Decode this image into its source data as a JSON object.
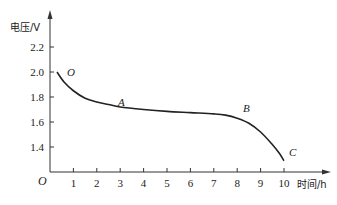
{
  "chart_data": {
    "type": "line",
    "title": "",
    "xlabel": "时间/h",
    "ylabel": "电压/V",
    "origin_label": "O",
    "x_ticks": [
      "1",
      "2",
      "3",
      "4",
      "5",
      "6",
      "7",
      "8",
      "9",
      "10"
    ],
    "y_ticks": [
      "1.4",
      "1.6",
      "1.8",
      "2.0",
      "2.2"
    ],
    "xlim": [
      0,
      10.5
    ],
    "ylim": [
      1.2,
      2.35
    ],
    "grid": false,
    "legend": null,
    "series": [
      {
        "name": "discharge curve",
        "x": [
          0.3,
          0.6,
          1.0,
          1.5,
          2.0,
          2.5,
          3.0,
          4.0,
          5.0,
          6.0,
          7.0,
          7.5,
          8.0,
          8.5,
          9.0,
          9.5,
          9.8,
          10.0
        ],
        "y": [
          2.0,
          1.92,
          1.85,
          1.79,
          1.76,
          1.74,
          1.72,
          1.7,
          1.685,
          1.675,
          1.665,
          1.655,
          1.63,
          1.59,
          1.52,
          1.42,
          1.35,
          1.29
        ],
        "color": "#222222"
      }
    ],
    "annotations": [
      {
        "text": "O",
        "x": 0.75,
        "y": 2.0
      },
      {
        "text": "A",
        "x": 3.0,
        "y": 1.75
      },
      {
        "text": "B",
        "x": 8.2,
        "y": 1.69
      },
      {
        "text": "C",
        "x": 10.2,
        "y": 1.33
      }
    ]
  }
}
